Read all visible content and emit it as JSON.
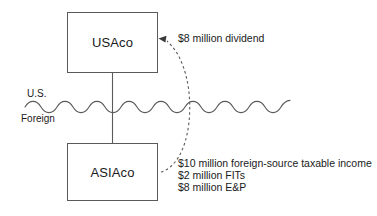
{
  "diagram": {
    "background_color": "#ffffff",
    "line_color": "#5a5a5a",
    "text_color": "#1a1a1a"
  },
  "entities": [
    {
      "id": "usaco",
      "label": "USAco"
    },
    {
      "id": "asiaco",
      "label": "ASIAco"
    }
  ],
  "border": {
    "upper_label": "U.S.",
    "lower_label": "Foreign",
    "style": "wavy-line"
  },
  "annotations": {
    "dividend": "$8 million dividend",
    "asiaco_facts": [
      "$10 million foreign-source taxable income",
      "$2 million FITs",
      "$8 million E&P"
    ]
  },
  "connectors": [
    {
      "id": "ownership-line",
      "from": "usaco",
      "to": "asiaco",
      "style": "solid",
      "arrow": false
    },
    {
      "id": "dividend-flow",
      "from": "asiaco",
      "to": "usaco",
      "style": "dashed",
      "arrow": true
    }
  ]
}
